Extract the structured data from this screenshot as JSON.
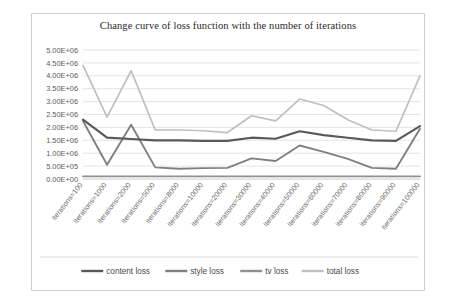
{
  "chart_data": {
    "type": "line",
    "title": "Change curve of loss function with the number of iterations",
    "xlabel": "",
    "ylabel": "",
    "grid": true,
    "legend_position": "bottom",
    "ylim": [
      0,
      5000000
    ],
    "ytick_labels": [
      "5.00E+06",
      "4.50E+06",
      "4.00E+06",
      "3.50E+06",
      "3.00E+06",
      "2.50E+06",
      "2.00E+06",
      "1.50E+06",
      "1.00E+06",
      "5.00E+05",
      "0.00E+00"
    ],
    "ytick_values": [
      5000000,
      4500000,
      4000000,
      3500000,
      3000000,
      2500000,
      2000000,
      1500000,
      1000000,
      500000,
      0
    ],
    "categories": [
      "iterations=100",
      "iterations=1000",
      "iterations=2000",
      "iterations=5000",
      "iterations=8000",
      "iterations=10000",
      "iterations=20000",
      "iterations=30000",
      "iterations=40000",
      "iterations=50000",
      "iterations=60000",
      "iterations=70000",
      "iterations=80000",
      "iterations=90000",
      "iterations=100000"
    ],
    "series": [
      {
        "name": "content loss",
        "color": "#595959",
        "values": [
          2300000,
          1600000,
          1550000,
          1500000,
          1500000,
          1480000,
          1480000,
          1600000,
          1560000,
          1850000,
          1700000,
          1600000,
          1500000,
          1480000,
          2050000
        ]
      },
      {
        "name": "style loss",
        "color": "#808080",
        "values": [
          2250000,
          550000,
          2100000,
          450000,
          400000,
          420000,
          430000,
          800000,
          700000,
          1300000,
          1050000,
          780000,
          430000,
          400000,
          1950000
        ]
      },
      {
        "name": "tv loss",
        "color": "#909090",
        "values": [
          100000,
          100000,
          100000,
          100000,
          100000,
          100000,
          100000,
          100000,
          100000,
          100000,
          100000,
          100000,
          100000,
          100000,
          100000
        ]
      },
      {
        "name": "total loss",
        "color": "#bfbfbf",
        "values": [
          4400000,
          2400000,
          4200000,
          1900000,
          1900000,
          1870000,
          1800000,
          2450000,
          2250000,
          3100000,
          2850000,
          2300000,
          1900000,
          1850000,
          4000000
        ]
      }
    ]
  }
}
